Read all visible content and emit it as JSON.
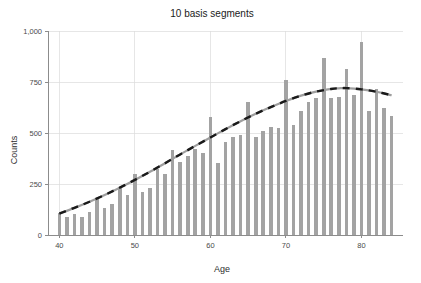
{
  "chart_data": {
    "type": "bar",
    "title": "10 basis segments",
    "xlabel": "Age",
    "ylabel": "Counts",
    "xlim": [
      38.5,
      85.5
    ],
    "ylim": [
      0,
      1000
    ],
    "grid": true,
    "legend": "none",
    "x_ticks": [
      40,
      50,
      60,
      70,
      80
    ],
    "x_tick_labels": [
      "40",
      "50",
      "60",
      "70",
      "80"
    ],
    "y_ticks": [
      0,
      250,
      500,
      750,
      1000
    ],
    "y_tick_labels": [
      "0",
      "250",
      "500",
      "750",
      "1,000"
    ],
    "bar_color": "#a3a3a3",
    "curve_color": "#1a1a1a",
    "categories": [
      40,
      41,
      42,
      43,
      44,
      45,
      46,
      47,
      48,
      49,
      50,
      51,
      52,
      53,
      54,
      55,
      56,
      57,
      58,
      59,
      60,
      61,
      62,
      63,
      64,
      65,
      66,
      67,
      68,
      69,
      70,
      71,
      72,
      73,
      74,
      75,
      76,
      77,
      78,
      79,
      80,
      81,
      82,
      83,
      84
    ],
    "series": [
      {
        "name": "Counts",
        "type": "bar",
        "values": [
          108,
          86,
          104,
          88,
          113,
          177,
          132,
          150,
          228,
          196,
          300,
          210,
          232,
          325,
          300,
          415,
          360,
          385,
          420,
          402,
          578,
          352,
          455,
          480,
          490,
          650,
          482,
          510,
          530,
          525,
          760,
          540,
          608,
          650,
          672,
          870,
          670,
          678,
          812,
          688,
          945,
          608,
          718,
          622,
          582
        ]
      },
      {
        "name": "Fitted spline",
        "type": "line",
        "style": "dashed",
        "x": [
          40,
          42,
          44,
          46,
          48,
          50,
          52,
          54,
          56,
          58,
          60,
          62,
          64,
          66,
          68,
          70,
          72,
          74,
          76,
          77,
          78,
          80,
          82,
          84
        ],
        "values": [
          105,
          133,
          163,
          196,
          232,
          270,
          310,
          352,
          395,
          437,
          478,
          519,
          558,
          594,
          627,
          657,
          683,
          703,
          716,
          719,
          720,
          714,
          702,
          685
        ]
      }
    ]
  }
}
